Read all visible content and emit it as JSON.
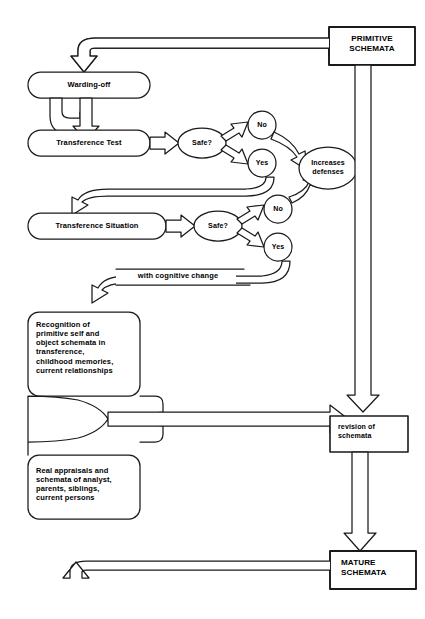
{
  "diagram": {
    "stroke_color": "#1a1a1a",
    "fill_color": "#ffffff",
    "background": "#ffffff"
  },
  "nodes": {
    "primitive_schemata": {
      "label": "PRIMITIVE\nSCHEMATA",
      "line1": "PRIMITIVE",
      "line2": "SCHEMATA",
      "shape": "rectangle"
    },
    "warding_off": {
      "label": "Warding-off",
      "shape": "rounded-rectangle"
    },
    "transference_test": {
      "label": "Transference Test",
      "shape": "rounded-rectangle"
    },
    "safe_test": {
      "label": "Safe?",
      "shape": "ellipse"
    },
    "test_no": {
      "label": "No",
      "shape": "circle"
    },
    "test_yes": {
      "label": "Yes",
      "shape": "circle"
    },
    "increases_defenses": {
      "line1": "Increases",
      "line2": "defenses",
      "shape": "ellipse"
    },
    "transference_situation": {
      "label": "Transference Situation",
      "shape": "rounded-rectangle"
    },
    "safe_situation": {
      "label": "Safe?",
      "shape": "ellipse"
    },
    "situation_no": {
      "label": "No",
      "shape": "circle"
    },
    "situation_yes": {
      "label": "Yes",
      "shape": "circle"
    },
    "cognitive_change": {
      "label": "with cognitive change",
      "shape": "arrow-label"
    },
    "recognition": {
      "shape": "rounded-rectangle",
      "lines": [
        "Recognition of",
        "primitive self and",
        "object schemata in",
        "transference,",
        "childhood memories,",
        "current relationships"
      ]
    },
    "real_appraisals": {
      "shape": "rounded-rectangle",
      "lines": [
        "Real appraisals and",
        "schemata of analyst,",
        "parents, siblings,",
        "current persons"
      ]
    },
    "revision_of_schemata": {
      "line1": "revision of",
      "line2": "schemata",
      "shape": "rectangle"
    },
    "mature_schemata": {
      "line1": "MATURE",
      "line2": "SCHEMATA",
      "shape": "rectangle"
    }
  },
  "edges": [
    {
      "name": "primitive-to-warding-off",
      "from": "primitive_schemata",
      "to": "warding_off",
      "style": "hollow-block-arrow"
    },
    {
      "name": "warding-off-to-transference-test",
      "from": "warding_off",
      "to": "transference_test",
      "style": "hollow-block-arrow"
    },
    {
      "name": "transference-test-to-safe",
      "from": "transference_test",
      "to": "safe_test",
      "style": "hollow-block-arrow"
    },
    {
      "name": "safe-to-no",
      "from": "safe_test",
      "to": "test_no",
      "style": "hollow-block-arrow"
    },
    {
      "name": "safe-to-yes",
      "from": "safe_test",
      "to": "test_yes",
      "style": "hollow-block-arrow"
    },
    {
      "name": "no-to-increases-defenses",
      "from": "test_no",
      "to": "increases_defenses",
      "style": "hollow-curved-arrow"
    },
    {
      "name": "yes-to-transference-situation",
      "from": "test_yes",
      "to": "transference_situation",
      "style": "hollow-curved-arrow"
    },
    {
      "name": "transference-situation-to-safe",
      "from": "transference_situation",
      "to": "safe_situation",
      "style": "hollow-block-arrow"
    },
    {
      "name": "safe2-to-no",
      "from": "safe_situation",
      "to": "situation_no",
      "style": "hollow-block-arrow"
    },
    {
      "name": "safe2-to-yes",
      "from": "safe_situation",
      "to": "situation_yes",
      "style": "hollow-block-arrow"
    },
    {
      "name": "no2-to-increases-defenses",
      "from": "situation_no",
      "to": "increases_defenses",
      "style": "hollow-curved-arrow"
    },
    {
      "name": "yes2-to-recognition",
      "from": "situation_yes",
      "to": "recognition",
      "label": "with cognitive change",
      "style": "hollow-curved-arrow"
    },
    {
      "name": "primitive-to-revision",
      "from": "primitive_schemata",
      "to": "revision_of_schemata",
      "style": "hollow-block-arrow"
    },
    {
      "name": "boxes-to-revision",
      "from": "recognition + real_appraisals",
      "to": "revision_of_schemata",
      "style": "hollow-block-arrow"
    },
    {
      "name": "revision-to-mature",
      "from": "revision_of_schemata",
      "to": "mature_schemata",
      "style": "hollow-block-arrow"
    },
    {
      "name": "mature-to-top-loop",
      "from": "mature_schemata",
      "to": "top",
      "style": "hollow-block-arrow"
    }
  ]
}
